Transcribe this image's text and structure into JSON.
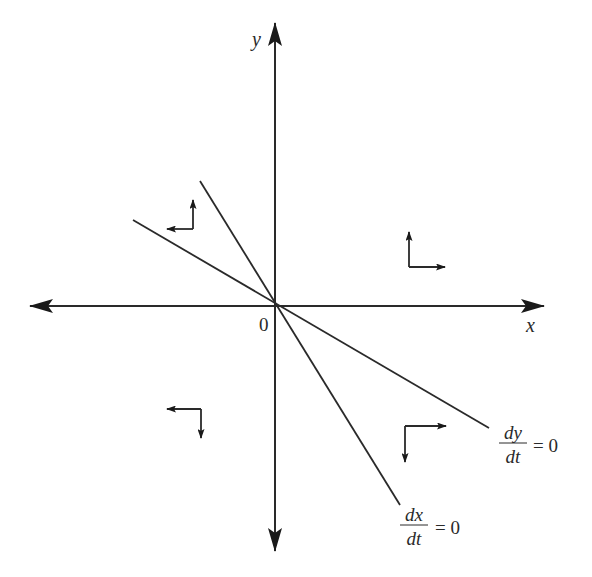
{
  "diagram": {
    "type": "phase-plane",
    "origin": {
      "x": 277,
      "y": 305
    },
    "colors": {
      "stroke": "#2a2a2a",
      "background": "#ffffff"
    },
    "axes": {
      "x": {
        "label": "x",
        "from": [
          30,
          306
        ],
        "to": [
          544,
          306
        ],
        "label_pos": [
          530,
          331
        ]
      },
      "y": {
        "label": "y",
        "from": [
          275,
          551
        ],
        "to": [
          275,
          23
        ],
        "label_pos": [
          256,
          46
        ]
      },
      "origin_label": {
        "text": "0",
        "pos": [
          265,
          330
        ]
      }
    },
    "nullclines": [
      {
        "name": "dy-dt-zero",
        "numerator": "dy",
        "denominator": "dt",
        "equals": "= 0",
        "from": [
          133,
          220
        ],
        "to": [
          489,
          428
        ],
        "label_pos": {
          "num": [
            513,
            439
          ],
          "bar_y": 442,
          "bar_x": [
            497,
            529
          ],
          "den": [
            513,
            466
          ],
          "eq": [
            533,
            453
          ]
        }
      },
      {
        "name": "dx-dt-zero",
        "numerator": "dx",
        "denominator": "dt",
        "equals": "= 0",
        "from": [
          200,
          181
        ],
        "to": [
          400,
          505
        ],
        "label_pos": {
          "num": [
            413,
            519
          ],
          "bar_y": 526,
          "bar_x": [
            398,
            429
          ],
          "den": [
            413,
            550
          ],
          "eq": [
            435,
            538
          ]
        }
      }
    ],
    "direction_indicators": [
      {
        "name": "upper-left",
        "corner": [
          193,
          229
        ],
        "horizontal": "left",
        "vertical": "up",
        "h_tip": [
          167,
          229
        ],
        "v_tip": [
          193,
          200
        ]
      },
      {
        "name": "upper-right",
        "corner": [
          409,
          267
        ],
        "horizontal": "right",
        "vertical": "up",
        "h_tip": [
          445,
          267
        ],
        "v_tip": [
          409,
          232
        ]
      },
      {
        "name": "lower-left",
        "corner": [
          201,
          409
        ],
        "horizontal": "left",
        "vertical": "down",
        "h_tip": [
          167,
          409
        ],
        "v_tip": [
          201,
          438
        ]
      },
      {
        "name": "lower-right",
        "corner": [
          405,
          426
        ],
        "horizontal": "right",
        "vertical": "down",
        "h_tip": [
          446,
          426
        ],
        "v_tip": [
          405,
          462
        ]
      }
    ]
  }
}
